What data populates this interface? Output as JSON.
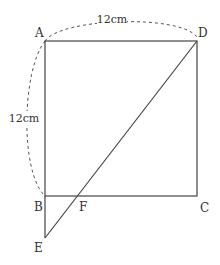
{
  "diagram": {
    "type": "geometry",
    "colors": {
      "stroke": "#444444",
      "text": "#333333",
      "background": "#ffffff"
    },
    "points": {
      "A": {
        "label": "A",
        "x": 45,
        "y": 41
      },
      "B": {
        "label": "B",
        "x": 45,
        "y": 196
      },
      "C": {
        "label": "C",
        "x": 197,
        "y": 196
      },
      "D": {
        "label": "D",
        "x": 197,
        "y": 41
      },
      "E": {
        "label": "E",
        "x": 45,
        "y": 238
      },
      "F": {
        "label": "F",
        "x": 78,
        "y": 196
      }
    },
    "segments": [
      "AD",
      "DC",
      "CB",
      "BA",
      "BE",
      "DE"
    ],
    "dimensions": {
      "top": {
        "label": "12cm",
        "from": "A",
        "to": "D"
      },
      "left": {
        "label": "12cm",
        "from": "A",
        "to": "B"
      }
    }
  }
}
